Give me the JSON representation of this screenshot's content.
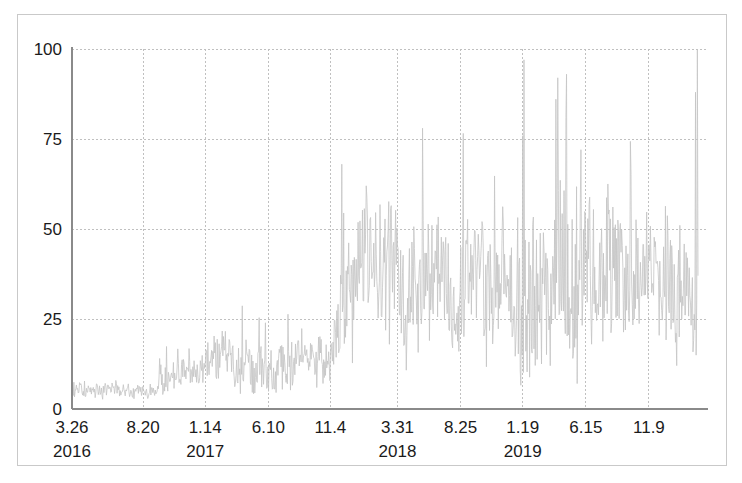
{
  "figure": {
    "background_color": "#ffffff",
    "frame_color": "#c9c9c9",
    "axis_color": "#8a8a8a",
    "grid_color": "#c0c0c0",
    "series_color": "#c4c4c4",
    "tick_label_color": "#1b1b1b"
  },
  "chart_data": {
    "type": "line",
    "title": "",
    "xlabel": "",
    "ylabel": "",
    "ylim": [
      0,
      100
    ],
    "yticks": [
      0,
      25,
      50,
      75,
      100
    ],
    "ytick_labels": [
      "0",
      "25",
      "50",
      "75",
      "100"
    ],
    "grid": true,
    "grid_style": "dotted",
    "legend": "none",
    "xtick_labels": [
      "3.26",
      "8.20",
      "1.14",
      "6.10",
      "11.4",
      "3.31",
      "8.25",
      "1.19",
      "6.15",
      "11.9"
    ],
    "xtick_years": [
      "2016",
      "",
      "2017",
      "",
      "",
      "2018",
      "",
      "2019",
      "",
      ""
    ],
    "xtick_positions_frac": [
      0.0,
      0.1136,
      0.2128,
      0.3136,
      0.4128,
      0.52,
      0.6208,
      0.72,
      0.8208,
      0.9216
    ],
    "x_index_range": [
      0,
      1000
    ],
    "series": [
      {
        "name": "value",
        "regimes": [
          {
            "label": "2016 low-level baseline",
            "x_start_frac": 0.0,
            "x_end_frac": 0.135,
            "mean": 4.5,
            "amplitude": 4.0,
            "min": 1,
            "max": 9
          },
          {
            "label": "late 2016 rise",
            "x_start_frac": 0.135,
            "x_end_frac": 0.2,
            "mean": 9.0,
            "amplitude": 9.0,
            "min": 2,
            "max": 18
          },
          {
            "label": "2017 mid-level volatile",
            "x_start_frac": 0.2,
            "x_end_frac": 0.412,
            "mean": 14.0,
            "amplitude": 14.0,
            "min": 4,
            "max": 32
          },
          {
            "label": "2018 high-volatility regime shift",
            "x_start_frac": 0.412,
            "x_end_frac": 0.7,
            "mean": 31.0,
            "amplitude": 36.0,
            "min": 5,
            "max": 78
          },
          {
            "label": "2019 peak volatility",
            "x_start_frac": 0.7,
            "x_end_frac": 0.88,
            "mean": 40.0,
            "amplitude": 48.0,
            "min": 6,
            "max": 97
          },
          {
            "label": "late 2019 sustained",
            "x_start_frac": 0.88,
            "x_end_frac": 1.0,
            "mean": 34.0,
            "amplitude": 34.0,
            "min": 8,
            "max": 100
          }
        ]
      }
    ]
  }
}
